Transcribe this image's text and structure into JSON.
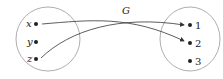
{
  "function_label": "G",
  "domain_set": {
    "elements": [
      "x",
      "y",
      "z"
    ]
  },
  "codomain_set": {
    "elements": [
      "1",
      "2",
      "3"
    ]
  },
  "mappings": [
    {
      "from": "x",
      "to": "2"
    },
    {
      "from": "z",
      "to": "1"
    }
  ],
  "colors": {
    "stroke": "#333333",
    "circle": "#999999"
  }
}
